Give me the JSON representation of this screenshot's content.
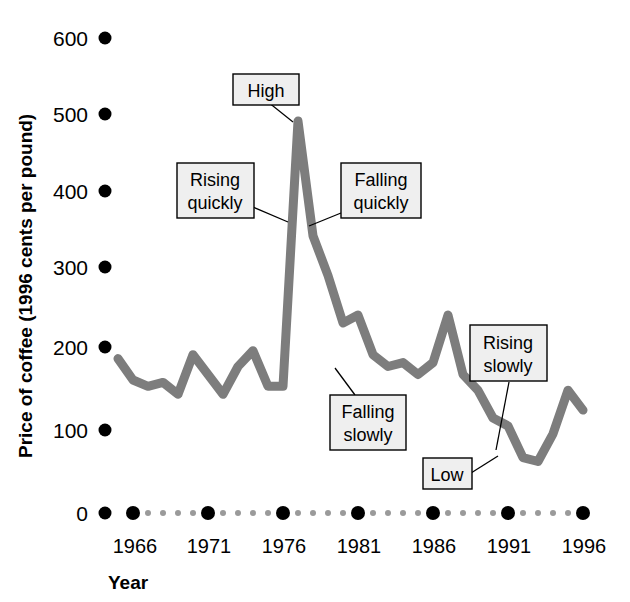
{
  "chart_data": {
    "type": "line",
    "title": "",
    "xlabel": "Year",
    "ylabel": "Price of coffee (1996 cents per pound)",
    "xlim": [
      1965,
      1996
    ],
    "ylim": [
      0,
      600
    ],
    "ytick_labels": [
      "600",
      "500",
      "400",
      "300",
      "200",
      "100",
      "0"
    ],
    "ytick_values": [
      600,
      500,
      400,
      300,
      200,
      100,
      0
    ],
    "xtick_labels": [
      "1966",
      "1971",
      "1976",
      "1981",
      "1986",
      "1991",
      "1996"
    ],
    "xtick_values": [
      1966,
      1971,
      1976,
      1981,
      1986,
      1991,
      1996
    ],
    "grid": false,
    "legend": "none",
    "series": [
      {
        "name": "Price of coffee",
        "x": [
          1965,
          1966,
          1967,
          1968,
          1969,
          1970,
          1971,
          1972,
          1973,
          1974,
          1975,
          1976,
          1977,
          1978,
          1979,
          1980,
          1981,
          1982,
          1983,
          1984,
          1985,
          1986,
          1987,
          1988,
          1989,
          1990,
          1991,
          1992,
          1993,
          1994,
          1995,
          1996
        ],
        "values": [
          195,
          168,
          160,
          165,
          150,
          200,
          175,
          150,
          185,
          205,
          160,
          160,
          495,
          350,
          300,
          240,
          250,
          200,
          185,
          190,
          175,
          190,
          250,
          175,
          155,
          120,
          110,
          70,
          65,
          100,
          155,
          130
        ]
      }
    ],
    "annotations": [
      {
        "label": "High",
        "lines": [
          "High"
        ],
        "target_year": 1977,
        "target_value": 490
      },
      {
        "label": "Rising quickly",
        "lines": [
          "Rising",
          "quickly"
        ],
        "target_year": 1976.6,
        "target_value": 330
      },
      {
        "label": "Falling quickly",
        "lines": [
          "Falling",
          "quickly"
        ],
        "target_year": 1977.6,
        "target_value": 325
      },
      {
        "label": "Falling slowly",
        "lines": [
          "Falling",
          "slowly"
        ],
        "target_year": 1982.5,
        "target_value": 190
      },
      {
        "label": "Rising slowly",
        "lines": [
          "Rising",
          "slowly"
        ],
        "target_year": 1993,
        "target_value": 67
      },
      {
        "label": "Low",
        "lines": [
          "Low"
        ],
        "target_year": 1993,
        "target_value": 65
      }
    ]
  }
}
